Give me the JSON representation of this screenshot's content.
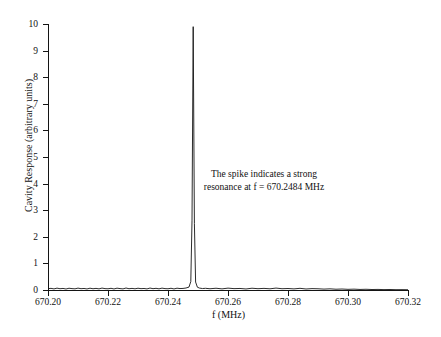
{
  "figure": {
    "background_color": "#ffffff",
    "line_color": "#141414"
  },
  "chart_data": {
    "type": "line",
    "title": "",
    "xlabel": "f (MHz)",
    "ylabel": "Cavity Response (arbitrary units)",
    "xlim": [
      670.2,
      670.32
    ],
    "ylim": [
      0,
      10
    ],
    "grid": false,
    "legend": null,
    "x_ticks": [
      670.2,
      670.22,
      670.24,
      670.26,
      670.28,
      670.3,
      670.32
    ],
    "x_tick_labels": [
      "670.20",
      "670.22",
      "670.24",
      "670.26",
      "670.28",
      "670.30",
      "670.32"
    ],
    "y_ticks": [
      0,
      1,
      2,
      3,
      4,
      5,
      6,
      7,
      8,
      9,
      10
    ],
    "y_tick_labels": [
      "0",
      "1",
      "2",
      "3",
      "4",
      "5",
      "6",
      "7",
      "8",
      "9",
      "10"
    ],
    "annotations": [
      {
        "text_lines": [
          "The spike indicates a strong",
          "resonance at f = 670.2484 MHz"
        ],
        "x": 670.2645,
        "y": 4.3
      }
    ],
    "peak": {
      "x": 670.2484,
      "y": 9.9,
      "label": "resonance peak"
    },
    "series": [
      {
        "name": "Cavity response",
        "color": "#141414",
        "x": [
          670.2,
          670.201,
          670.202,
          670.203,
          670.204,
          670.205,
          670.206,
          670.207,
          670.208,
          670.209,
          670.21,
          670.211,
          670.212,
          670.213,
          670.214,
          670.215,
          670.216,
          670.217,
          670.218,
          670.219,
          670.22,
          670.221,
          670.222,
          670.223,
          670.224,
          670.225,
          670.226,
          670.227,
          670.228,
          670.229,
          670.23,
          670.231,
          670.232,
          670.233,
          670.234,
          670.235,
          670.236,
          670.237,
          670.238,
          670.239,
          670.24,
          670.241,
          670.242,
          670.243,
          670.244,
          670.245,
          670.246,
          670.247,
          670.2476,
          670.248,
          670.2484,
          670.2488,
          670.2492,
          670.2498,
          670.2505,
          670.2515,
          670.2525,
          670.254,
          670.256,
          670.258,
          670.26,
          670.262,
          670.264,
          670.266,
          670.268,
          670.27,
          670.272,
          670.274,
          670.276,
          670.278,
          670.28,
          670.282,
          670.284,
          670.286,
          670.288,
          670.29,
          670.292,
          670.294,
          670.296,
          670.298,
          670.3,
          670.302,
          670.304,
          670.306,
          670.308,
          670.31,
          670.312,
          670.314,
          670.316,
          670.318,
          670.32
        ],
        "y": [
          0.05,
          0.062,
          0.041,
          0.07,
          0.048,
          0.059,
          0.038,
          0.066,
          0.052,
          0.044,
          0.071,
          0.049,
          0.058,
          0.04,
          0.068,
          0.047,
          0.061,
          0.043,
          0.072,
          0.051,
          0.046,
          0.064,
          0.039,
          0.069,
          0.053,
          0.042,
          0.074,
          0.048,
          0.06,
          0.045,
          0.067,
          0.05,
          0.057,
          0.041,
          0.073,
          0.049,
          0.063,
          0.044,
          0.07,
          0.052,
          0.047,
          0.065,
          0.04,
          0.068,
          0.054,
          0.059,
          0.075,
          0.11,
          0.32,
          2.6,
          9.9,
          2.5,
          0.3,
          0.105,
          0.072,
          0.055,
          0.064,
          0.047,
          0.066,
          0.043,
          0.07,
          0.051,
          0.058,
          0.039,
          0.067,
          0.049,
          0.061,
          0.045,
          0.072,
          0.048,
          0.056,
          0.042,
          0.063,
          0.038,
          0.052,
          0.046,
          0.034,
          0.044,
          0.029,
          0.037,
          0.025,
          0.032,
          0.021,
          0.027,
          0.018,
          0.022,
          0.015,
          0.019,
          0.012,
          0.014,
          0.01
        ]
      }
    ]
  }
}
